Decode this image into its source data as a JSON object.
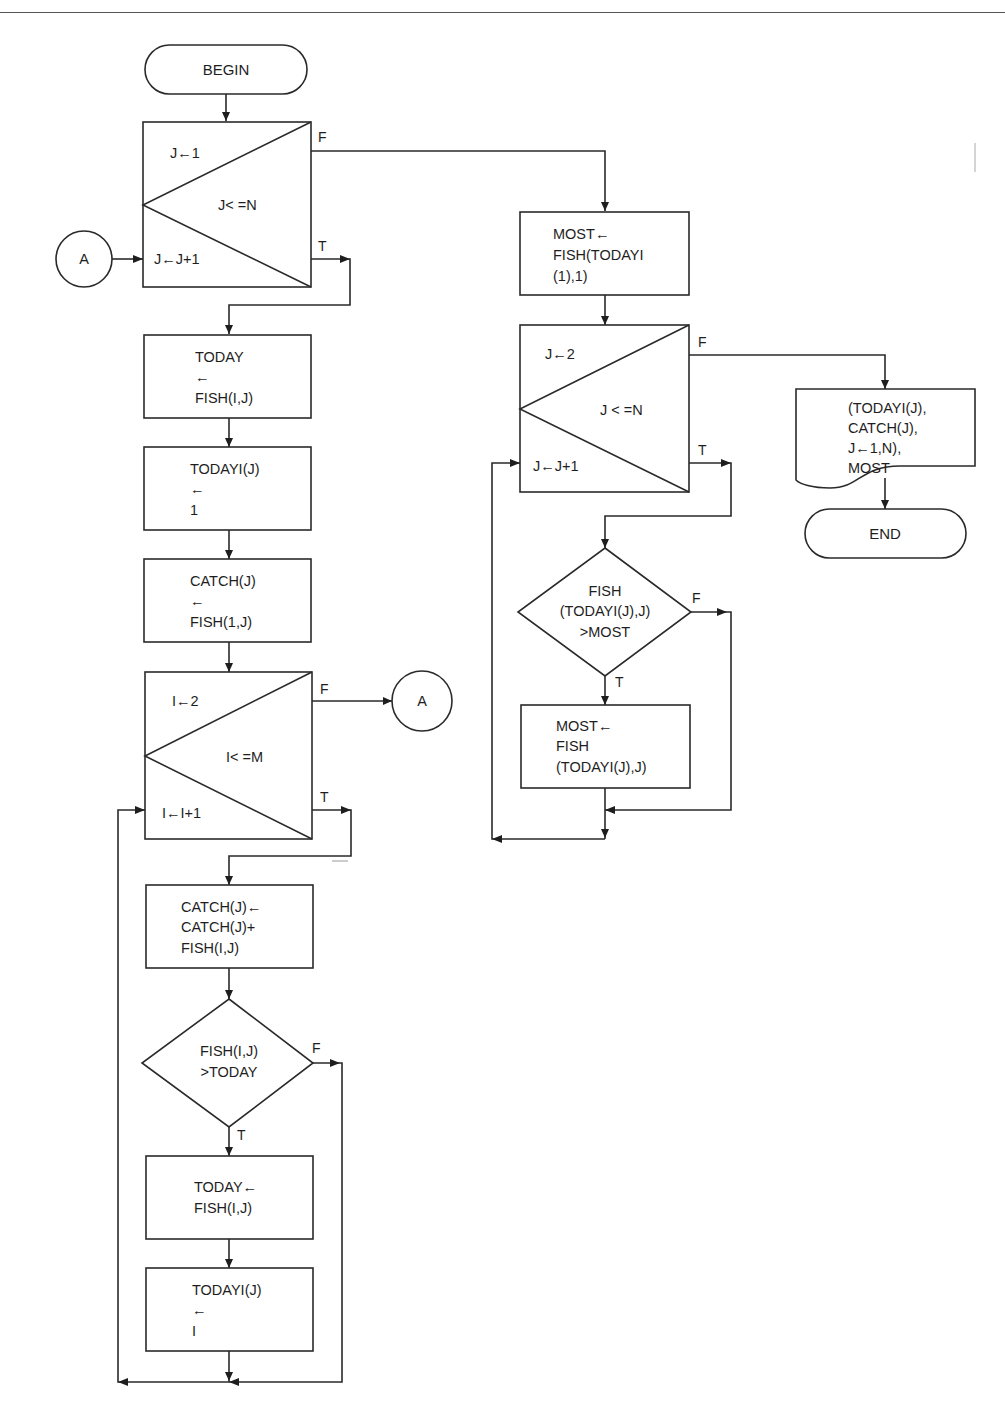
{
  "diagram": {
    "type": "flowchart",
    "terminals": {
      "begin": "BEGIN",
      "end": "END"
    },
    "connectors": {
      "a_in": "A",
      "a_out": "A"
    },
    "loop_outer_j": {
      "init": "J←1",
      "condition": "J< =N",
      "increment": "J←J+1",
      "false_label": "F",
      "true_label": "T"
    },
    "box_today": [
      "TODAY",
      "←",
      "FISH(I,J)"
    ],
    "box_todayi": [
      "TODAYI(J)",
      "←",
      "1"
    ],
    "box_catch_init": [
      "CATCH(J)",
      "←",
      "FISH(1,J)"
    ],
    "loop_inner_i": {
      "init": "I←2",
      "condition": "I< =M",
      "increment": "I←I+1",
      "false_label": "F",
      "true_label": "T"
    },
    "box_catch_accum": [
      "CATCH(J)←",
      "CATCH(J)+",
      "FISH(I,J)"
    ],
    "decision_today": {
      "lines": [
        "FISH(I,J)",
        ">TODAY"
      ],
      "false_label": "F",
      "true_label": "T"
    },
    "box_today_update": [
      "TODAY←",
      "FISH(I,J)"
    ],
    "box_todayi_update": [
      "TODAYI(J)",
      "←",
      "I"
    ],
    "box_most_init": [
      "MOST←",
      "FISH(TODAYI",
      "(1),1)"
    ],
    "loop_j2": {
      "init": "J←2",
      "condition": "J < =N",
      "increment": "J←J+1",
      "false_label": "F",
      "true_label": "T"
    },
    "decision_most": {
      "lines": [
        "FISH",
        "(TODAYI(J),J)",
        ">MOST"
      ],
      "false_label": "F",
      "true_label": "T"
    },
    "box_most_update": [
      "MOST←",
      "FISH",
      "(TODAYI(J),J)"
    ],
    "output_doc": [
      "(TODAYI(J),",
      "CATCH(J),",
      "J←1,N),",
      "MOST"
    ]
  }
}
